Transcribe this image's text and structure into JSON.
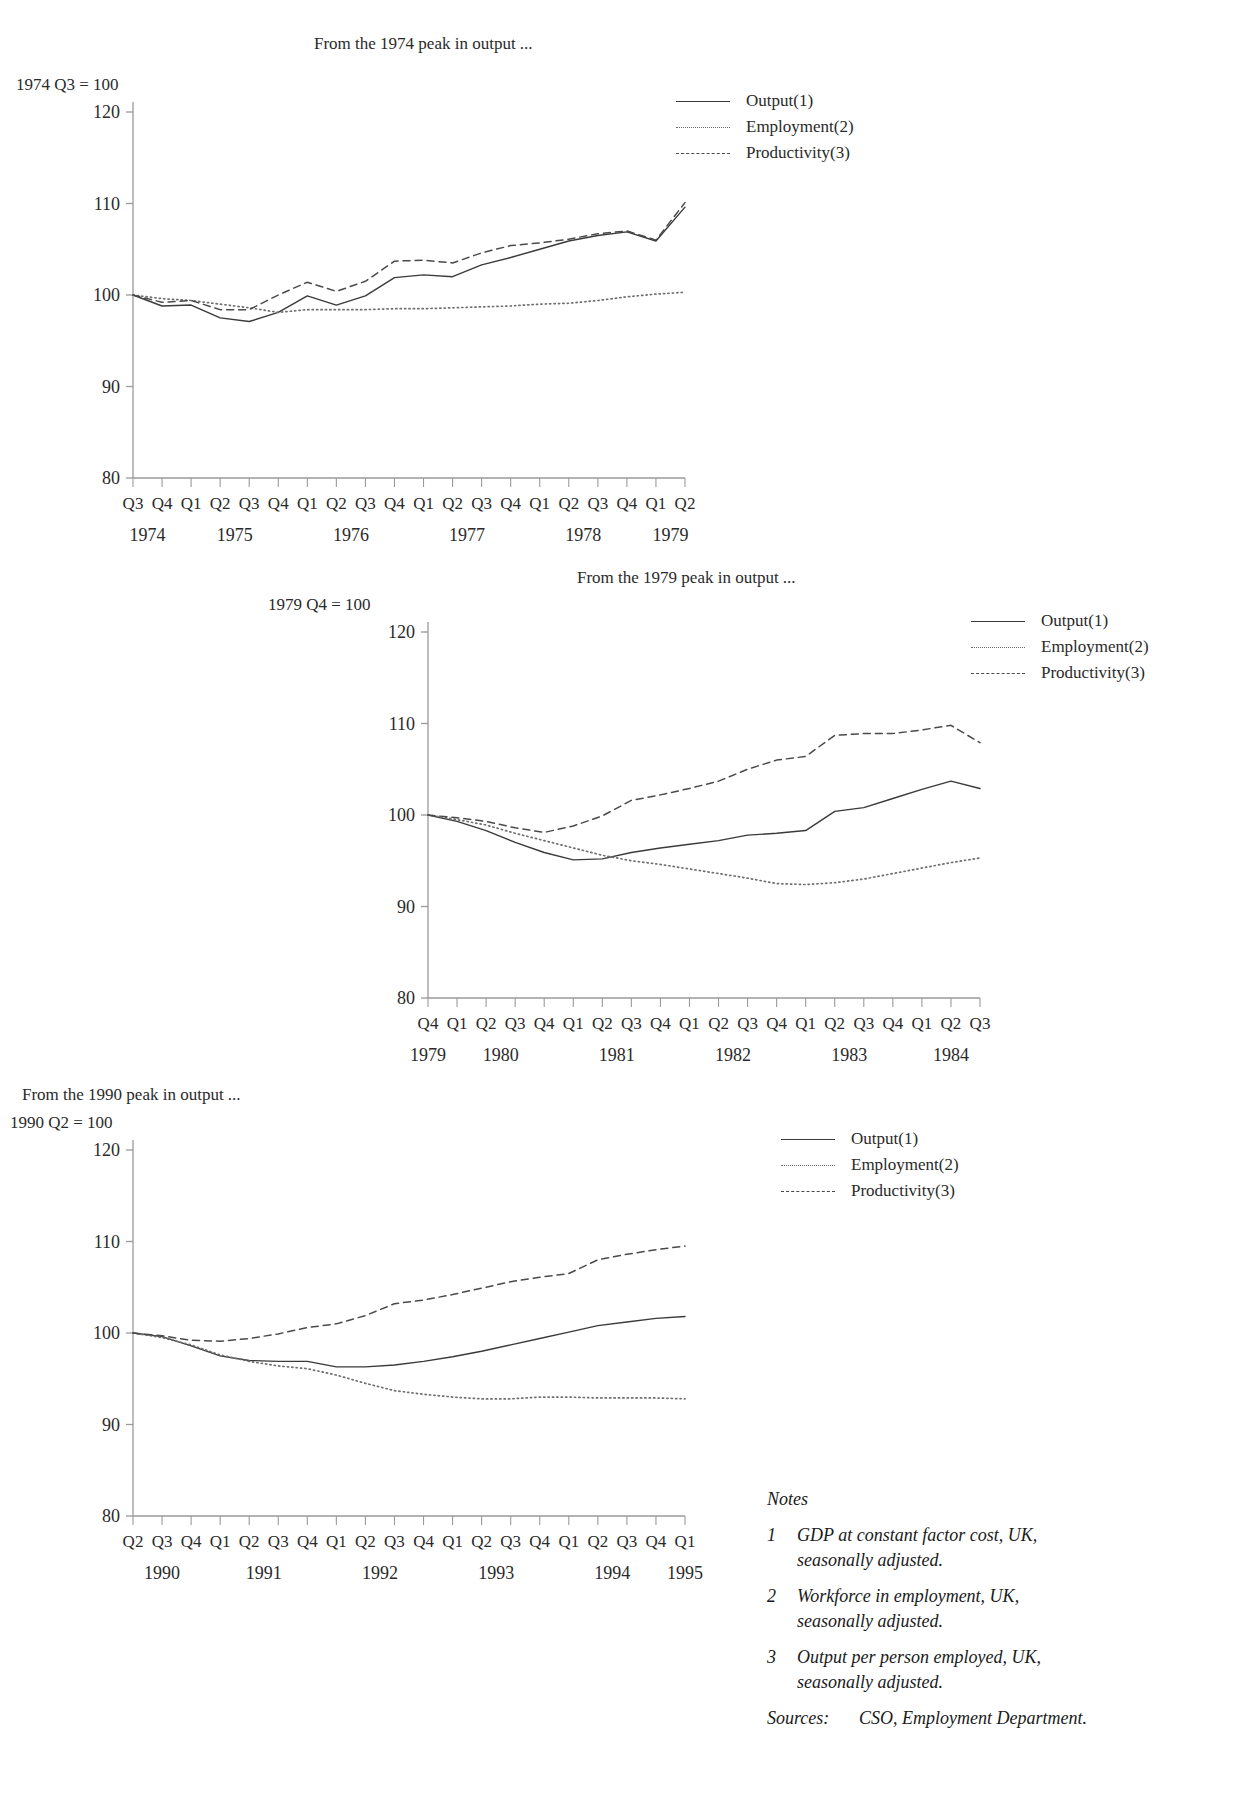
{
  "page": {
    "background": "#ffffff",
    "ink": "#1a1a1a"
  },
  "charts": [
    {
      "id": "chart-1974",
      "caption": "From the 1974 peak in output ...",
      "index_label": "1974 Q3 = 100",
      "legend": [
        {
          "label": "Output(1)",
          "style": "solid"
        },
        {
          "label": "Employment(2)",
          "style": "dotted"
        },
        {
          "label": "Productivity(3)",
          "style": "dashed"
        }
      ]
    },
    {
      "id": "chart-1979",
      "caption": "From the 1979 peak in output ...",
      "index_label": "1979 Q4 = 100",
      "legend": [
        {
          "label": "Output(1)",
          "style": "solid"
        },
        {
          "label": "Employment(2)",
          "style": "dotted"
        },
        {
          "label": "Productivity(3)",
          "style": "dashed"
        }
      ]
    },
    {
      "id": "chart-1990",
      "caption": "From the 1990 peak in output ...",
      "index_label": "1990 Q2 = 100",
      "legend": [
        {
          "label": "Output(1)",
          "style": "solid"
        },
        {
          "label": "Employment(2)",
          "style": "dotted"
        },
        {
          "label": "Productivity(3)",
          "style": "dashed"
        }
      ]
    }
  ],
  "notes": {
    "heading": "Notes",
    "items": [
      {
        "num": "1",
        "text": "GDP at constant factor cost, UK, seasonally adjusted."
      },
      {
        "num": "2",
        "text": "Workforce in employment, UK, seasonally adjusted."
      },
      {
        "num": "3",
        "text": "Output per person employed, UK, seasonally adjusted."
      }
    ],
    "sources_label": "Sources:",
    "sources_text": "CSO, Employment Department."
  },
  "chart_data": [
    {
      "type": "line",
      "id": "chart-1974",
      "title": "From the 1974 peak in output ...",
      "ylabel": "1974 Q3 = 100",
      "xlabel": "",
      "ylim": [
        80,
        120
      ],
      "yticks": [
        80,
        90,
        100,
        110,
        120
      ],
      "grid": false,
      "legend_position": "top-right",
      "categories": [
        "Q3",
        "Q4",
        "Q1",
        "Q2",
        "Q3",
        "Q4",
        "Q1",
        "Q2",
        "Q3",
        "Q4",
        "Q1",
        "Q2",
        "Q3",
        "Q4",
        "Q1",
        "Q2",
        "Q3",
        "Q4",
        "Q1",
        "Q2"
      ],
      "year_groups": [
        {
          "year": "1974",
          "start": 0,
          "span": 2
        },
        {
          "year": "1975",
          "start": 2,
          "span": 4
        },
        {
          "year": "1976",
          "start": 6,
          "span": 4
        },
        {
          "year": "1977",
          "start": 10,
          "span": 4
        },
        {
          "year": "1978",
          "start": 14,
          "span": 4
        },
        {
          "year": "1979",
          "start": 18,
          "span": 2
        }
      ],
      "series": [
        {
          "name": "Output(1)",
          "style": "solid",
          "values": [
            100.0,
            98.8,
            98.9,
            97.5,
            97.1,
            98.1,
            99.9,
            98.9,
            99.9,
            101.9,
            102.2,
            102.0,
            103.3,
            104.1,
            105.0,
            105.9,
            106.5,
            106.9,
            105.9,
            109.6
          ]
        },
        {
          "name": "Employment(2)",
          "style": "dotted",
          "values": [
            100.0,
            99.6,
            99.4,
            99.0,
            98.6,
            98.1,
            98.4,
            98.4,
            98.4,
            98.5,
            98.5,
            98.6,
            98.7,
            98.8,
            99.0,
            99.1,
            99.4,
            99.8,
            100.1,
            100.3
          ]
        },
        {
          "name": "Productivity(3)",
          "style": "dashed",
          "values": [
            100.0,
            99.2,
            99.4,
            98.4,
            98.4,
            100.0,
            101.4,
            100.4,
            101.5,
            103.7,
            103.8,
            103.5,
            104.6,
            105.4,
            105.7,
            106.1,
            106.7,
            107.0,
            106.0,
            110.1
          ]
        }
      ]
    },
    {
      "type": "line",
      "id": "chart-1979",
      "title": "From the 1979 peak in output ...",
      "ylabel": "1979 Q4 = 100",
      "xlabel": "",
      "ylim": [
        80,
        120
      ],
      "yticks": [
        80,
        90,
        100,
        110,
        120
      ],
      "grid": false,
      "legend_position": "top-right",
      "categories": [
        "Q4",
        "Q1",
        "Q2",
        "Q3",
        "Q4",
        "Q1",
        "Q2",
        "Q3",
        "Q4",
        "Q1",
        "Q2",
        "Q3",
        "Q4",
        "Q1",
        "Q2",
        "Q3",
        "Q4",
        "Q1",
        "Q2",
        "Q3"
      ],
      "year_groups": [
        {
          "year": "1979",
          "start": 0,
          "span": 1
        },
        {
          "year": "1980",
          "start": 1,
          "span": 4
        },
        {
          "year": "1981",
          "start": 5,
          "span": 4
        },
        {
          "year": "1982",
          "start": 9,
          "span": 4
        },
        {
          "year": "1983",
          "start": 13,
          "span": 4
        },
        {
          "year": "1984",
          "start": 17,
          "span": 3
        }
      ],
      "series": [
        {
          "name": "Output(1)",
          "style": "solid",
          "values": [
            100.0,
            99.3,
            98.3,
            97.0,
            95.9,
            95.1,
            95.2,
            95.9,
            96.4,
            96.8,
            97.2,
            97.8,
            98.0,
            98.3,
            100.4,
            100.8,
            101.8,
            102.8,
            103.7,
            102.9
          ]
        },
        {
          "name": "Employment(2)",
          "style": "dotted",
          "values": [
            100.0,
            99.5,
            98.9,
            98.0,
            97.2,
            96.4,
            95.6,
            95.0,
            94.6,
            94.1,
            93.6,
            93.1,
            92.5,
            92.4,
            92.6,
            93.0,
            93.6,
            94.2,
            94.8,
            95.3
          ]
        },
        {
          "name": "Productivity(3)",
          "style": "dashed",
          "values": [
            100.0,
            99.7,
            99.3,
            98.6,
            98.1,
            98.8,
            99.9,
            101.6,
            102.2,
            102.9,
            103.7,
            105.0,
            106.0,
            106.4,
            108.7,
            108.9,
            108.9,
            109.3,
            109.8,
            107.9
          ]
        }
      ]
    },
    {
      "type": "line",
      "id": "chart-1990",
      "title": "From the 1990 peak in output ...",
      "ylabel": "1990 Q2 = 100",
      "xlabel": "",
      "ylim": [
        80,
        120
      ],
      "yticks": [
        80,
        90,
        100,
        110,
        120
      ],
      "grid": false,
      "legend_position": "top-right",
      "categories": [
        "Q2",
        "Q3",
        "Q4",
        "Q1",
        "Q2",
        "Q3",
        "Q4",
        "Q1",
        "Q2",
        "Q3",
        "Q4",
        "Q1",
        "Q2",
        "Q3",
        "Q4",
        "Q1",
        "Q2",
        "Q3",
        "Q4",
        "Q1"
      ],
      "year_groups": [
        {
          "year": "1990",
          "start": 0,
          "span": 3
        },
        {
          "year": "1991",
          "start": 3,
          "span": 4
        },
        {
          "year": "1992",
          "start": 7,
          "span": 4
        },
        {
          "year": "1993",
          "start": 11,
          "span": 4
        },
        {
          "year": "1994",
          "start": 15,
          "span": 4
        },
        {
          "year": "1995",
          "start": 19,
          "span": 1
        }
      ],
      "series": [
        {
          "name": "Output(1)",
          "style": "solid",
          "values": [
            100.0,
            99.6,
            98.6,
            97.5,
            97.0,
            96.9,
            96.9,
            96.3,
            96.3,
            96.5,
            96.9,
            97.4,
            98.0,
            98.7,
            99.4,
            100.1,
            100.8,
            101.2,
            101.6,
            101.8
          ]
        },
        {
          "name": "Employment(2)",
          "style": "dotted",
          "values": [
            100.0,
            99.5,
            98.7,
            97.6,
            96.9,
            96.4,
            96.1,
            95.4,
            94.5,
            93.7,
            93.3,
            93.0,
            92.8,
            92.8,
            93.0,
            93.0,
            92.9,
            92.9,
            92.9,
            92.8
          ]
        },
        {
          "name": "Productivity(3)",
          "style": "dashed",
          "values": [
            100.0,
            99.7,
            99.2,
            99.1,
            99.4,
            99.9,
            100.6,
            101.0,
            101.9,
            103.2,
            103.6,
            104.2,
            104.9,
            105.6,
            106.1,
            106.5,
            108.0,
            108.6,
            109.1,
            109.5
          ]
        }
      ]
    }
  ]
}
